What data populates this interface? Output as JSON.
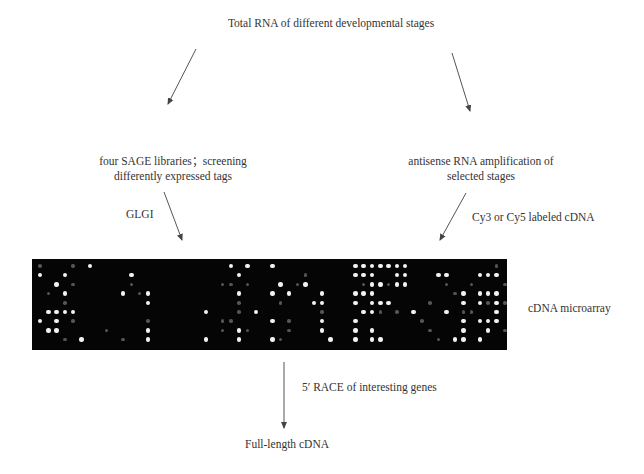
{
  "diagram": {
    "title_node": "Total RNA of different developmental stages",
    "left_branch": {
      "step1_line1": "four SAGE libraries；screening",
      "step1_line2": "differently expressed tags",
      "arrow_label": "GLGI"
    },
    "right_branch": {
      "step1_line1": "antisense RNA amplification of",
      "step1_line2": "selected stages",
      "arrow_label": "Cy3 or Cy5 labeled cDNA"
    },
    "microarray_label": "cDNA microarray",
    "bottom_arrow_label": "5′ RACE of interesting genes",
    "final_node": "Full-length cDNA"
  },
  "colors": {
    "background": "#ffffff",
    "text": "#333333",
    "arrow": "#444444",
    "array_background": "#050505",
    "spot_bright": "#f2f2f2",
    "spot_dim": "#555555"
  },
  "microarray": {
    "pitch_x": 8.3,
    "pitch_y": 9.2,
    "origin_x": 8,
    "origin_y": 7,
    "bright_spots": [
      [
        0,
        1
      ],
      [
        3,
        1
      ],
      [
        6,
        0
      ],
      [
        2,
        2
      ],
      [
        11,
        1
      ],
      [
        3,
        3
      ],
      [
        10,
        3
      ],
      [
        13,
        3
      ],
      [
        13,
        4
      ],
      [
        1,
        5
      ],
      [
        2,
        5
      ],
      [
        3,
        5
      ],
      [
        4,
        5
      ],
      [
        0,
        6
      ],
      [
        2,
        6
      ],
      [
        1,
        7
      ],
      [
        2,
        7
      ],
      [
        13,
        7
      ],
      [
        5,
        8
      ],
      [
        13,
        8
      ],
      [
        23,
        0
      ],
      [
        25,
        0
      ],
      [
        24,
        1
      ],
      [
        24,
        3
      ],
      [
        24,
        7
      ],
      [
        20,
        5
      ],
      [
        24,
        8
      ],
      [
        20,
        8
      ],
      [
        26,
        5
      ],
      [
        28,
        0
      ],
      [
        32,
        2
      ],
      [
        34,
        3
      ],
      [
        34,
        4
      ],
      [
        33,
        4
      ],
      [
        34,
        6
      ],
      [
        28,
        6
      ],
      [
        34,
        7
      ],
      [
        28,
        8
      ],
      [
        35,
        8
      ],
      [
        29,
        2
      ],
      [
        30,
        3
      ],
      [
        28,
        3
      ],
      [
        38,
        0
      ],
      [
        39,
        0
      ],
      [
        40,
        0
      ],
      [
        41,
        0
      ],
      [
        42,
        0
      ],
      [
        43,
        0
      ],
      [
        44,
        0
      ],
      [
        38,
        1
      ],
      [
        39,
        1
      ],
      [
        40,
        1
      ],
      [
        43,
        1
      ],
      [
        44,
        1
      ],
      [
        40,
        2
      ],
      [
        41,
        2
      ],
      [
        43,
        2
      ],
      [
        44,
        2
      ],
      [
        38,
        3
      ],
      [
        39,
        3
      ],
      [
        40,
        3
      ],
      [
        38,
        4
      ],
      [
        40,
        4
      ],
      [
        41,
        4
      ],
      [
        42,
        4
      ],
      [
        39,
        5
      ],
      [
        40,
        5
      ],
      [
        45,
        5
      ],
      [
        38,
        6
      ],
      [
        38,
        7
      ],
      [
        40,
        7
      ],
      [
        38,
        8
      ],
      [
        40,
        8
      ],
      [
        41,
        8
      ],
      [
        48,
        1
      ],
      [
        49,
        1
      ],
      [
        49,
        5
      ],
      [
        51,
        3
      ],
      [
        51,
        4
      ],
      [
        51,
        6
      ],
      [
        51,
        7
      ],
      [
        51,
        8
      ],
      [
        50,
        8
      ],
      [
        53,
        1
      ],
      [
        54,
        1
      ],
      [
        55,
        1
      ],
      [
        58,
        0
      ],
      [
        57,
        1
      ],
      [
        59,
        2
      ],
      [
        61,
        1
      ],
      [
        53,
        3
      ],
      [
        54,
        3
      ],
      [
        55,
        3
      ],
      [
        53,
        4
      ],
      [
        55,
        4
      ],
      [
        53,
        6
      ],
      [
        54,
        6
      ],
      [
        55,
        6
      ],
      [
        57,
        6
      ],
      [
        54,
        7
      ],
      [
        60,
        4
      ],
      [
        55,
        5
      ],
      [
        62,
        3
      ],
      [
        62,
        4
      ],
      [
        62,
        6
      ],
      [
        62,
        7
      ],
      [
        62,
        8
      ],
      [
        59,
        8
      ],
      [
        60,
        8
      ],
      [
        53,
        8
      ]
    ],
    "dim_spots": [
      [
        0,
        0
      ],
      [
        4,
        0
      ],
      [
        1,
        3
      ],
      [
        3,
        4
      ],
      [
        4,
        6
      ],
      [
        4,
        2
      ],
      [
        3,
        8
      ],
      [
        8,
        7
      ],
      [
        10,
        8
      ],
      [
        13,
        6
      ],
      [
        11,
        2
      ],
      [
        12,
        3
      ],
      [
        22,
        2
      ],
      [
        22,
        6
      ],
      [
        23,
        2
      ],
      [
        25,
        2
      ],
      [
        23,
        6
      ],
      [
        24,
        4
      ],
      [
        22,
        7
      ],
      [
        24,
        5
      ],
      [
        25,
        7
      ],
      [
        29,
        4
      ],
      [
        30,
        6
      ],
      [
        32,
        1
      ],
      [
        30,
        7
      ],
      [
        29,
        8
      ],
      [
        34,
        5
      ],
      [
        31,
        2
      ],
      [
        39,
        2
      ],
      [
        42,
        2
      ],
      [
        39,
        0
      ],
      [
        41,
        5
      ],
      [
        43,
        5
      ],
      [
        47,
        4
      ],
      [
        46,
        6
      ],
      [
        48,
        8
      ],
      [
        47,
        7
      ],
      [
        50,
        3
      ],
      [
        51,
        5
      ],
      [
        49,
        2
      ],
      [
        56,
        2
      ],
      [
        55,
        0
      ],
      [
        57,
        3
      ],
      [
        56,
        4
      ],
      [
        54,
        4
      ],
      [
        58,
        5
      ],
      [
        57,
        7
      ],
      [
        58,
        6
      ],
      [
        61,
        6
      ],
      [
        61,
        5
      ],
      [
        62,
        5
      ],
      [
        52,
        5
      ],
      [
        52,
        2
      ],
      [
        56,
        7
      ]
    ]
  }
}
